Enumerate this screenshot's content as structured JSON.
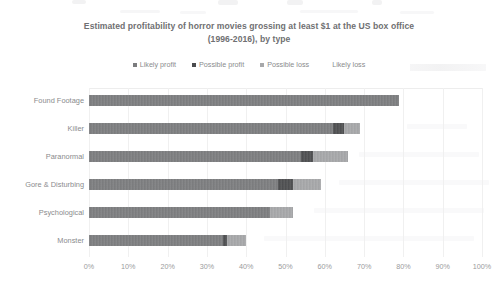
{
  "chart_data": {
    "type": "bar",
    "orientation": "horizontal",
    "stacked": true,
    "stack_mode": "absolute_percent",
    "title": "Estimated profitability of horror movies grossing at least $1 at the US box office (1996-2016), by type",
    "title_line1": "Estimated profitability of horror movies grossing at least $1 at the US box office",
    "title_line2": "(1996-2016), by type",
    "xlabel": "",
    "ylabel": "",
    "xlim": [
      0,
      100
    ],
    "xtick_labels": [
      "0%",
      "10%",
      "20%",
      "30%",
      "40%",
      "50%",
      "60%",
      "70%",
      "80%",
      "90%",
      "100%"
    ],
    "xtick_values": [
      0,
      10,
      20,
      30,
      40,
      50,
      60,
      70,
      80,
      90,
      100
    ],
    "grid": true,
    "grid_axis": "x",
    "legend_position": "top",
    "categories": [
      "Found Footage",
      "Killer",
      "Paranormal",
      "Gore & Disturbing",
      "Psychological",
      "Monster"
    ],
    "series": [
      {
        "name": "Likely profit",
        "color": "#7b7c7e",
        "values": [
          79,
          62,
          54,
          48,
          46,
          34
        ]
      },
      {
        "name": "Possible profit",
        "color": "#4b4c4e",
        "values": [
          0,
          3,
          3,
          4,
          0,
          1
        ]
      },
      {
        "name": "Possible loss",
        "color": "#a7a8aa",
        "values": [
          0,
          4,
          9,
          7,
          6,
          5
        ]
      },
      {
        "name": "Likely loss",
        "color": "#d9d9da",
        "values": [
          0,
          0,
          0,
          0,
          0,
          0
        ]
      }
    ],
    "totals": [
      79,
      69,
      66,
      59,
      52,
      40
    ]
  },
  "colors": {
    "likely_profit": "#7b7c7e",
    "possible_profit": "#4b4c4e",
    "possible_loss": "#a7a8aa",
    "likely_loss": "#d9d9da",
    "title_text": "#6f7072",
    "axis_text": "#9a9b9d",
    "grid": "#f0f0f0",
    "background": "#ffffff"
  }
}
